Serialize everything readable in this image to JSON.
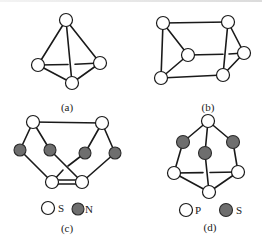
{
  "figure": {
    "panels": [
      {
        "id": "a",
        "label": "(a)",
        "description": "tetrahedron of 4 open atoms"
      },
      {
        "id": "b",
        "label": "(b)",
        "description": "triangular prism of 6 open atoms"
      },
      {
        "id": "c",
        "label": "(c)",
        "description": "S4N4-type cage: 4 S (open) and 4 N (filled)",
        "legend": [
          {
            "symbol": "open-circle",
            "text": "S"
          },
          {
            "symbol": "filled-circle",
            "text": "N"
          }
        ]
      },
      {
        "id": "d",
        "label": "(d)",
        "description": "P4S3-type cage: 4 P (open) and 3 S (filled)",
        "legend": [
          {
            "symbol": "open-circle",
            "text": "P"
          },
          {
            "symbol": "filled-circle",
            "text": "S"
          }
        ]
      }
    ],
    "colors": {
      "line": "#1a1a1a",
      "open_fill": "#ffffff",
      "filled": "#6e6e6e"
    }
  }
}
